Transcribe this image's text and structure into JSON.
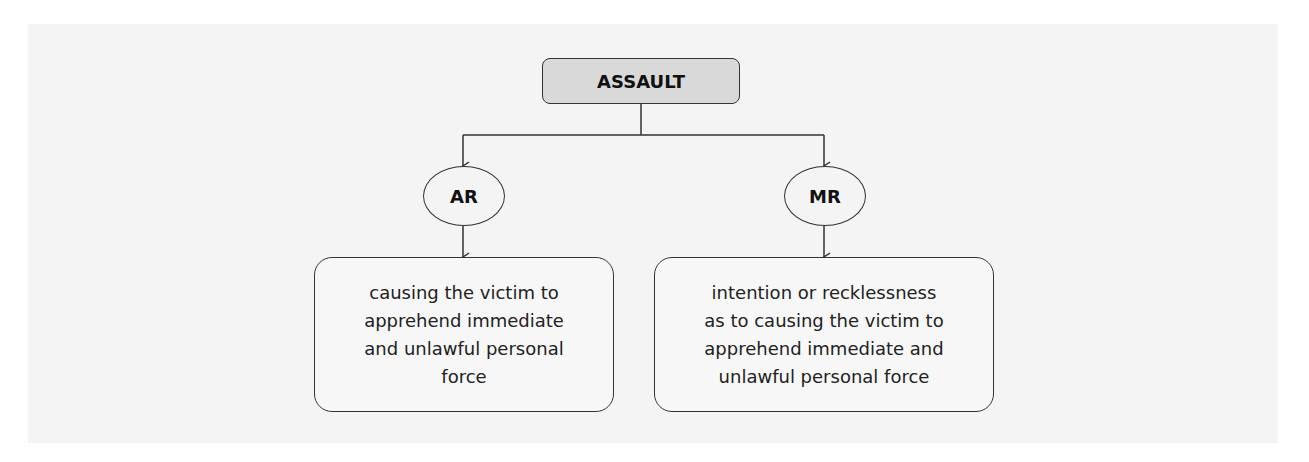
{
  "diagram": {
    "root": {
      "label": "ASSAULT"
    },
    "branches": [
      {
        "label": "AR",
        "description": "causing the victim to\napprehend immediate\nand unlawful personal\nforce"
      },
      {
        "label": "MR",
        "description": "intention or recklessness\nas to causing the victim to\napprehend immediate and\nunlawful personal force"
      }
    ]
  },
  "colors": {
    "root_fill": "#d9d9d9",
    "stroke": "#333333",
    "background": "#f4f4f4"
  }
}
